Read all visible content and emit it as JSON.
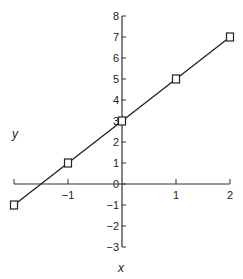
{
  "chart_data": {
    "type": "line",
    "title": "",
    "xlabel": "x",
    "ylabel": "y",
    "xlim": [
      -2,
      2
    ],
    "ylim": [
      -3,
      8
    ],
    "x_ticks": [
      -2,
      -1,
      0,
      1,
      2
    ],
    "x_tick_labels": [
      "",
      "−1",
      "",
      "1",
      "2"
    ],
    "y_ticks": [
      -3,
      -2,
      -1,
      0,
      1,
      2,
      3,
      4,
      5,
      6,
      7,
      8
    ],
    "y_tick_labels": [
      "−3",
      "−2",
      "−1",
      "0",
      "1",
      "2",
      "3",
      "4",
      "5",
      "6",
      "7",
      "8"
    ],
    "grid": false,
    "legend": null,
    "series": [
      {
        "name": "y = 2x + 3",
        "marker": "open-square",
        "x": [
          -2,
          -1,
          0,
          1,
          2
        ],
        "y": [
          -1,
          1,
          3,
          5,
          7
        ]
      }
    ]
  }
}
